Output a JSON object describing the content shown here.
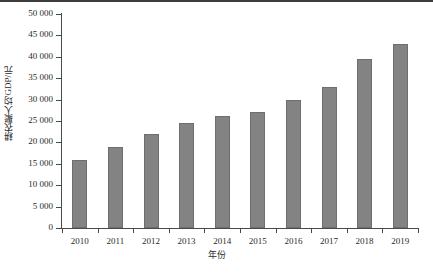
{
  "chart_data": {
    "type": "bar",
    "title": "",
    "xlabel": "年份",
    "ylabel": "耕农聚人均GDP/元",
    "categories": [
      "2010",
      "2011",
      "2012",
      "2013",
      "2014",
      "2015",
      "2016",
      "2017",
      "2018",
      "2019"
    ],
    "values": [
      16000,
      19000,
      22000,
      24500,
      26200,
      27000,
      30000,
      33000,
      39500,
      43000
    ],
    "ylim": [
      0,
      50000
    ],
    "ytick_step": 5000,
    "ytick_labels": [
      "0",
      "5 000",
      "10 000",
      "15 000",
      "20 000",
      "25 000",
      "30 000",
      "35 000",
      "40 000",
      "45 000",
      "50 000"
    ],
    "ytick_values": [
      0,
      5000,
      10000,
      15000,
      20000,
      25000,
      30000,
      35000,
      40000,
      45000,
      50000
    ],
    "grid": false,
    "legend": false,
    "legend_position": "none",
    "bar_color": "#838383",
    "bar_edge_color": "#6e6e6e",
    "axis_color": "#4a4a4a",
    "background": "#ffffff",
    "thousands_separator": " "
  },
  "caption": {
    "text": ""
  }
}
